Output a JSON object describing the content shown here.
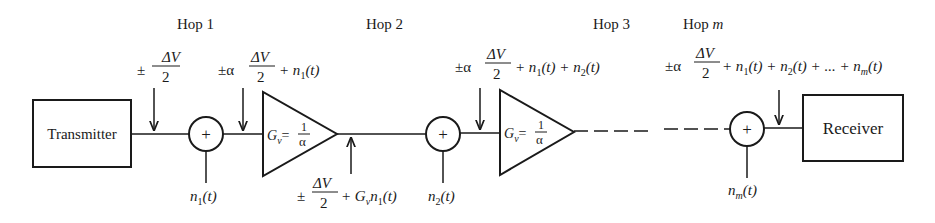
{
  "hops": [
    {
      "label": "Hop 1"
    },
    {
      "label": "Hop 2"
    },
    {
      "label": "Hop 3"
    },
    {
      "label_prefix": "Hop",
      "label_var": "m"
    }
  ],
  "blocks": {
    "transmitter": "Transmitter",
    "receiver": "Receiver"
  },
  "summer_symbol": "+",
  "amplifier": {
    "gain_symbol": "G",
    "gain_subscript": "v",
    "equals": "=",
    "numerator": "1",
    "denominator": "α"
  },
  "signals": {
    "transmit": {
      "pm": "±",
      "num": "ΔV",
      "den": "2"
    },
    "pre_amp1": {
      "pm": "±α",
      "num": "ΔV",
      "den": "2",
      "tail": "+ n",
      "tail_sub": "1",
      "tail_end": "(t)"
    },
    "post_amp1": {
      "pm": "±",
      "num": "ΔV",
      "den": "2",
      "tail_a": "+ G",
      "tail_sub_a": "v",
      "tail_b": "n",
      "tail_sub_b": "1",
      "tail_end": "(t)"
    },
    "pre_amp2": {
      "pm": "±α",
      "num": "ΔV",
      "den": "2",
      "t1": "+ n",
      "s1": "1",
      "e1": "(t) + n",
      "s2": "2",
      "e2": "(t)"
    },
    "receiver_in": {
      "pm": "±α",
      "num": "ΔV",
      "den": "2",
      "t1": "+ n",
      "s1": "1",
      "e1": "(t) + n",
      "s2": "2",
      "e2": "(t) + ... + n",
      "sm": "m",
      "em": "(t)"
    }
  },
  "noise_sources": [
    {
      "base": "n",
      "sub": "1",
      "arg": "(t)"
    },
    {
      "base": "n",
      "sub": "2",
      "arg": "(t)"
    },
    {
      "base": "n",
      "sub": "m",
      "arg": "(t)"
    }
  ]
}
